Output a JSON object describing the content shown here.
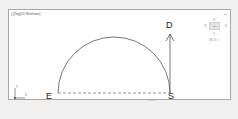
{
  "viewport": {
    "label": "[-][Top][2D Wireframe]"
  },
  "viewcube": {
    "tools": "▪▪▪",
    "north": "N",
    "west": "W",
    "east": "E",
    "south": "S",
    "face": "TOP",
    "wcs": "WCS ▾"
  },
  "drawing": {
    "points": {
      "E": "E",
      "S": "S",
      "D": "D"
    },
    "note": "———"
  },
  "ucs": {
    "x": "X",
    "y": "Y"
  },
  "colors": {
    "background": "#f0f0f0",
    "viewport": "#ffffff",
    "border": "#a8a8a8",
    "line": "#555555"
  }
}
